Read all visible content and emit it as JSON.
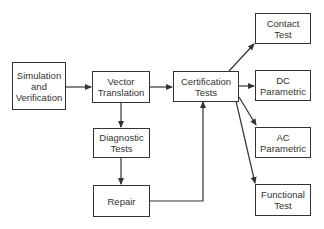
{
  "diagram": {
    "type": "flowchart",
    "nodes": [
      {
        "id": "sim",
        "label": "Simulation\nand\nVerification"
      },
      {
        "id": "vec",
        "label": "Vector\nTranslation"
      },
      {
        "id": "diag",
        "label": "Diagnostic\nTests"
      },
      {
        "id": "repair",
        "label": "Repair"
      },
      {
        "id": "cert",
        "label": "Certification\nTests"
      },
      {
        "id": "contact",
        "label": "Contact\nTest"
      },
      {
        "id": "dc",
        "label": "DC\nParametric"
      },
      {
        "id": "ac",
        "label": "AC\nParametric"
      },
      {
        "id": "func",
        "label": "Functional\nTest"
      }
    ],
    "edges": [
      {
        "from": "sim",
        "to": "vec"
      },
      {
        "from": "vec",
        "to": "cert"
      },
      {
        "from": "vec",
        "to": "diag"
      },
      {
        "from": "diag",
        "to": "repair"
      },
      {
        "from": "repair",
        "to": "cert"
      },
      {
        "from": "cert",
        "to": "contact"
      },
      {
        "from": "cert",
        "to": "dc"
      },
      {
        "from": "cert",
        "to": "ac"
      },
      {
        "from": "cert",
        "to": "func"
      }
    ],
    "colors": {
      "line": "#333333",
      "background": "#ffffff"
    }
  }
}
